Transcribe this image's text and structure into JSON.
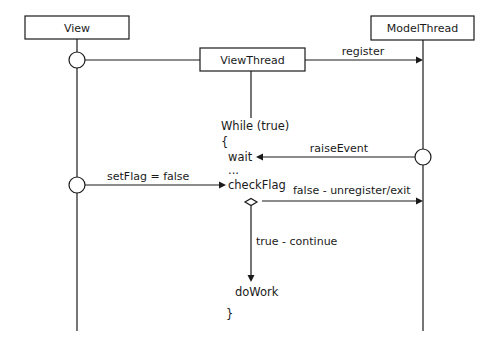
{
  "diagram": {
    "type": "sequence-diagram",
    "participants": [
      {
        "id": "view",
        "label": "View"
      },
      {
        "id": "viewthread",
        "label": "ViewThread"
      },
      {
        "id": "modelthread",
        "label": "ModelThread"
      }
    ],
    "messages": {
      "register": "register",
      "raise_event": "raiseEvent",
      "set_flag": "setFlag = false",
      "false_branch": "false - unregister/exit",
      "true_branch": "true - continue"
    },
    "code": {
      "while": "While (true)",
      "open_brace": "{",
      "wait": "wait",
      "ellipsis": "...",
      "check_flag": "checkFlag",
      "do_work": "doWork",
      "close_brace": "}"
    },
    "colors": {
      "stroke": "#1a1a1a",
      "background": "#ffffff"
    }
  }
}
